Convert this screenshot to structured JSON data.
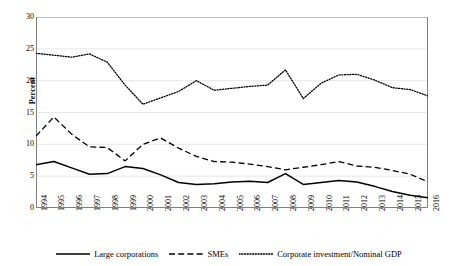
{
  "chart_data": {
    "type": "line",
    "title": "",
    "xlabel": "",
    "ylabel": "Percent",
    "ylim": [
      0,
      30
    ],
    "yticks": [
      0,
      5,
      10,
      15,
      20,
      25,
      30
    ],
    "grid": "horizontal",
    "legend_position": "bottom",
    "categories": [
      "1994",
      "1995",
      "1996",
      "1997",
      "1998",
      "1999",
      "2000",
      "2001",
      "2002",
      "2003",
      "2004",
      "2005",
      "2006",
      "2007",
      "2008",
      "2009",
      "2010",
      "2011",
      "2012",
      "2013",
      "2014",
      "2015",
      "2016"
    ],
    "series": [
      {
        "name": "Large corporations",
        "style": "solid",
        "color": "#000000",
        "values": [
          6.8,
          7.3,
          6.3,
          5.3,
          5.4,
          6.5,
          6.2,
          5.2,
          4.0,
          3.7,
          3.8,
          4.1,
          4.2,
          4.0,
          5.4,
          3.7,
          4.0,
          4.3,
          4.1,
          3.4,
          2.6,
          2.0,
          1.6
        ]
      },
      {
        "name": "SMEs",
        "style": "dashed",
        "color": "#000000",
        "values": [
          11.3,
          14.3,
          11.6,
          9.6,
          9.5,
          7.4,
          10.0,
          11.0,
          9.4,
          8.1,
          7.3,
          7.2,
          6.9,
          6.5,
          6.0,
          6.4,
          6.8,
          7.3,
          6.6,
          6.4,
          5.9,
          5.3,
          4.1
        ]
      },
      {
        "name": "Corporate investment/Nominal GDP",
        "style": "dotted",
        "color": "#000000",
        "values": [
          24.3,
          24.0,
          23.7,
          24.2,
          22.9,
          19.3,
          16.3,
          17.3,
          18.3,
          20.0,
          18.5,
          18.8,
          19.1,
          19.3,
          21.7,
          17.2,
          19.6,
          20.9,
          21.0,
          20.1,
          18.9,
          18.6,
          17.6
        ]
      }
    ]
  },
  "axis": {
    "y_title": "Percent"
  },
  "legend": {
    "items": [
      {
        "label": "Large corporations",
        "style": "solid"
      },
      {
        "label": "SMEs",
        "style": "dashed"
      },
      {
        "label": "Corporate investment/Nominal GDP",
        "style": "dotted"
      }
    ]
  }
}
